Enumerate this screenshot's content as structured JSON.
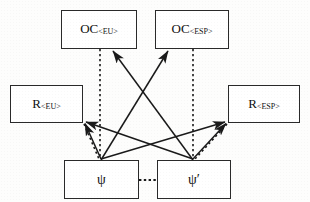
{
  "diagram": {
    "type": "node-link",
    "canvas": {
      "width": 310,
      "height": 202,
      "background": "#fdfdfc"
    },
    "style": {
      "solid_edge_color": "#1a1a1a",
      "dotted_edge_color": "#1a1a1a",
      "box_border_color": "#2a2a2a",
      "box_fill": "#ffffff",
      "text_color": "#111111"
    },
    "nodes": [
      {
        "id": "oc_eu",
        "label_main": "OC",
        "label_sub": "<EU>",
        "text": "OC<EU>",
        "x": 61,
        "y": 10,
        "w": 76,
        "h": 39
      },
      {
        "id": "oc_esp",
        "label_main": "OC",
        "label_sub": "<ESP>",
        "text": "OC<ESP>",
        "x": 155,
        "y": 10,
        "w": 74,
        "h": 39
      },
      {
        "id": "r_eu",
        "label_main": "R",
        "label_sub": "<EU>",
        "text": "R<EU>",
        "x": 10,
        "y": 85,
        "w": 73,
        "h": 38
      },
      {
        "id": "r_esp",
        "label_main": "R",
        "label_sub": "<ESP>",
        "text": "R<ESP>",
        "x": 228,
        "y": 85,
        "w": 72,
        "h": 38
      },
      {
        "id": "psi",
        "label_main": "ψ",
        "label_sub": "",
        "text": "ψ",
        "x": 64,
        "y": 160,
        "w": 75,
        "h": 39
      },
      {
        "id": "psi_p",
        "label_main": "ψ′",
        "label_sub": "",
        "text": "ψ′",
        "x": 157,
        "y": 160,
        "w": 74,
        "h": 39
      }
    ],
    "edges": [
      {
        "id": "e1",
        "from": "psi",
        "to": "oc_esp",
        "style": "solid",
        "arrow": "to"
      },
      {
        "id": "e2",
        "from": "psi_p",
        "to": "oc_eu",
        "style": "solid",
        "arrow": "to"
      },
      {
        "id": "e3",
        "from": "psi",
        "to": "r_esp",
        "style": "solid",
        "arrow": "to"
      },
      {
        "id": "e4",
        "from": "psi_p",
        "to": "r_eu",
        "style": "solid",
        "arrow": "to"
      },
      {
        "id": "e5",
        "from": "psi",
        "to": "r_eu",
        "style": "solid",
        "arrow": "to"
      },
      {
        "id": "e6",
        "from": "psi_p",
        "to": "r_esp",
        "style": "solid",
        "arrow": "to"
      },
      {
        "id": "e7",
        "from": "oc_eu",
        "to": "psi",
        "style": "dotted",
        "arrow": "none"
      },
      {
        "id": "e8",
        "from": "oc_esp",
        "to": "psi_p",
        "style": "dotted",
        "arrow": "none"
      },
      {
        "id": "e9",
        "from": "r_eu",
        "to": "psi",
        "style": "dotted",
        "arrow": "none"
      },
      {
        "id": "e10",
        "from": "r_esp",
        "to": "psi_p",
        "style": "dotted",
        "arrow": "none"
      },
      {
        "id": "e11",
        "from": "psi",
        "to": "psi_p",
        "style": "dotted",
        "arrow": "none"
      }
    ]
  }
}
